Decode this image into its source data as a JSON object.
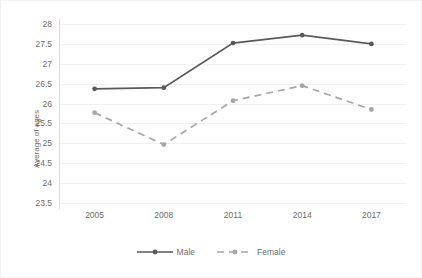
{
  "chart_data": {
    "type": "line",
    "title": "",
    "xlabel": "",
    "ylabel": "Average of ages",
    "x": [
      "2005",
      "2008",
      "2011",
      "2014",
      "2017"
    ],
    "categories": [
      "2005",
      "2008",
      "2011",
      "2014",
      "2017"
    ],
    "series": [
      {
        "name": "Male",
        "values": [
          26.37,
          26.4,
          27.52,
          27.72,
          27.5
        ],
        "color": "#595959",
        "style": "solid",
        "marker": "circle"
      },
      {
        "name": "Female",
        "values": [
          25.77,
          24.97,
          26.07,
          26.45,
          25.85
        ],
        "color": "#a6a6a6",
        "style": "dashed",
        "marker": "circle"
      }
    ],
    "ylim": [
      23.5,
      28.0
    ],
    "yticks": [
      "23.5",
      "24",
      "24.5",
      "25",
      "25.5",
      "26",
      "26.5",
      "27",
      "27.5",
      "28"
    ],
    "ytick_values": [
      23.5,
      24,
      24.5,
      25,
      25.5,
      26,
      26.5,
      27,
      27.5,
      28
    ],
    "grid": true,
    "grid_color": "#f0f0f0",
    "legend_position": "bottom",
    "axis_text_color": "#6d6d6d",
    "background": "#ffffff"
  },
  "legend": {
    "items": [
      {
        "label": "Male"
      },
      {
        "label": "Female"
      }
    ]
  }
}
